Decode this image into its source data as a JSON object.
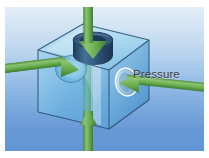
{
  "figure": {
    "label": "Pressure",
    "background": {
      "top_color": "#e4eef8",
      "bottom_color": "#6294d4",
      "border_color": "#ffffff"
    },
    "colors": {
      "arrow_green": "#64a84b",
      "arrow_green_dark": "#3f7c33",
      "arrow_green_light": "#8cc473",
      "cube_glass": "#7fc4e8",
      "cube_edge": "#2a4f72",
      "cube_face_left": "#63b4e2",
      "cube_face_right": "#4e9ed2",
      "cube_face_top": "#9fd6ef",
      "neck_dark": "#2c4a6b",
      "neck_mid": "#3d6489",
      "label_text": "#3b3b3b"
    },
    "objects": [
      {
        "name": "glass-cube",
        "kind": "transparent-cube"
      },
      {
        "name": "top-neck-cylinder",
        "kind": "cylinder",
        "position": "top-face"
      },
      {
        "name": "left-face-dimple",
        "kind": "circular-indentation",
        "position": "left-face"
      },
      {
        "name": "right-face-dimple",
        "kind": "circular-indentation",
        "position": "right-face"
      },
      {
        "name": "internal-cavity",
        "kind": "hourglass-cavity"
      }
    ],
    "arrows": [
      {
        "name": "arrow-top",
        "direction": "down",
        "label": ""
      },
      {
        "name": "arrow-left",
        "direction": "right",
        "label": ""
      },
      {
        "name": "arrow-right",
        "direction": "left",
        "label": "Pressure"
      },
      {
        "name": "arrow-bottom",
        "direction": "up",
        "label": ""
      }
    ]
  }
}
